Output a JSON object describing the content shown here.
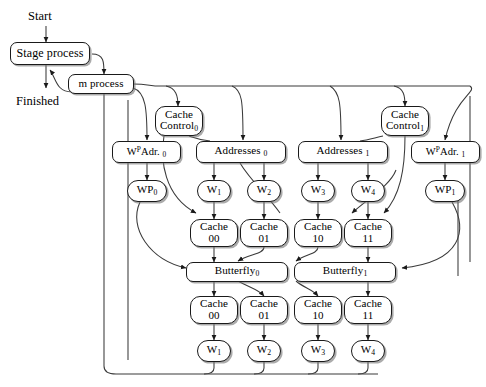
{
  "diagram": {
    "background": "#ffffff",
    "stroke_color": "#1a1a1a",
    "shadow_color": "#787878",
    "labels": {
      "start": "Start",
      "finished": "Finished"
    },
    "nodes": {
      "stage_process": "Stage process",
      "m_process": "m process",
      "cache_control_0_line1": "Cache",
      "cache_control_0_line2": "Control",
      "cache_control_0_sub": "0",
      "cache_control_1_line1": "Cache",
      "cache_control_1_line2": "Control",
      "cache_control_1_sub": "1",
      "wpadr_0_main": "W",
      "wpadr_0_sup": "P",
      "wpadr_0_rest": "Adr.",
      "wpadr_0_sub": "0",
      "wpadr_1_main": "W",
      "wpadr_1_sup": "P",
      "wpadr_1_rest": "Adr.",
      "wpadr_1_sub": "1",
      "addresses_0": "Addresses",
      "addresses_0_sub": "0",
      "addresses_1": "Addresses",
      "addresses_1_sub": "1",
      "wp_0": "WP",
      "wp_0_sub": "0",
      "wp_1": "WP",
      "wp_1_sub": "1",
      "w1_top": "W",
      "w1_top_sub": "1",
      "w2_top": "W",
      "w2_top_sub": "2",
      "w3_top": "W",
      "w3_top_sub": "3",
      "w4_top": "W",
      "w4_top_sub": "4",
      "cache_a0_line1": "Cache",
      "cache_a0_line2": "00",
      "cache_a1_line1": "Cache",
      "cache_a1_line2": "01",
      "cache_a2_line1": "Cache",
      "cache_a2_line2": "10",
      "cache_a3_line1": "Cache",
      "cache_a3_line2": "11",
      "butterfly_0": "Butterfly",
      "butterfly_0_sub": "0",
      "butterfly_1": "Butterfly",
      "butterfly_1_sub": "1",
      "cache_b0_line1": "Cache",
      "cache_b0_line2": "00",
      "cache_b1_line1": "Cache",
      "cache_b1_line2": "01",
      "cache_b2_line1": "Cache",
      "cache_b2_line2": "10",
      "cache_b3_line1": "Cache",
      "cache_b3_line2": "11",
      "w1_bot": "W",
      "w1_bot_sub": "1",
      "w2_bot": "W",
      "w2_bot_sub": "2",
      "w3_bot": "W",
      "w3_bot_sub": "3",
      "w4_bot": "W",
      "w4_bot_sub": "4"
    }
  }
}
